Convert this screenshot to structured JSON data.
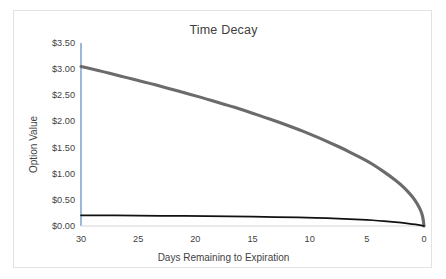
{
  "chart_data": {
    "type": "line",
    "title": "Time Decay",
    "xlabel": "Days Remaining to Expiration",
    "ylabel": "Option Value",
    "xlim": [
      30,
      0
    ],
    "ylim": [
      0,
      3.5
    ],
    "x_ticks": [
      30,
      25,
      20,
      15,
      10,
      5,
      0
    ],
    "x_tick_labels": [
      "30",
      "25",
      "20",
      "15",
      "10",
      "5",
      "0"
    ],
    "y_ticks": [
      0,
      0.5,
      1.0,
      1.5,
      2.0,
      2.5,
      3.0,
      3.5
    ],
    "y_tick_labels": [
      "$0.00",
      "$0.50",
      "$1.00",
      "$1.50",
      "$2.00",
      "$2.50",
      "$3.00",
      "$3.50"
    ],
    "x_axis_reversed": true,
    "grid": false,
    "legend": "none",
    "series": [
      {
        "name": "at-the-money option",
        "color": "#6b6b6b",
        "width": 3.1,
        "x": [
          30,
          29,
          28,
          27,
          26,
          25,
          24,
          23,
          22,
          21,
          20,
          19,
          18,
          17,
          16,
          15,
          14,
          13,
          12,
          11,
          10,
          9,
          8,
          7,
          6,
          5,
          4,
          3,
          2,
          1.5,
          1,
          0.6,
          0.3,
          0.1,
          0
        ],
        "values": [
          3.05,
          3.0,
          2.95,
          2.89,
          2.84,
          2.78,
          2.73,
          2.67,
          2.61,
          2.55,
          2.49,
          2.43,
          2.36,
          2.3,
          2.23,
          2.16,
          2.08,
          2.01,
          1.93,
          1.85,
          1.76,
          1.67,
          1.57,
          1.47,
          1.36,
          1.25,
          1.11,
          0.96,
          0.79,
          0.68,
          0.56,
          0.43,
          0.31,
          0.18,
          0.0
        ]
      },
      {
        "name": "out-of-the-money option",
        "color": "#111111",
        "width": 1.7,
        "x": [
          30,
          28,
          26,
          24,
          22,
          20,
          18,
          16,
          14,
          12,
          10,
          9,
          8,
          7,
          6,
          5,
          4,
          3,
          2,
          1,
          0.5,
          0
        ],
        "values": [
          0.205,
          0.203,
          0.2,
          0.197,
          0.194,
          0.19,
          0.186,
          0.181,
          0.175,
          0.168,
          0.159,
          0.153,
          0.146,
          0.138,
          0.128,
          0.117,
          0.103,
          0.086,
          0.065,
          0.038,
          0.021,
          0.0
        ]
      }
    ]
  }
}
